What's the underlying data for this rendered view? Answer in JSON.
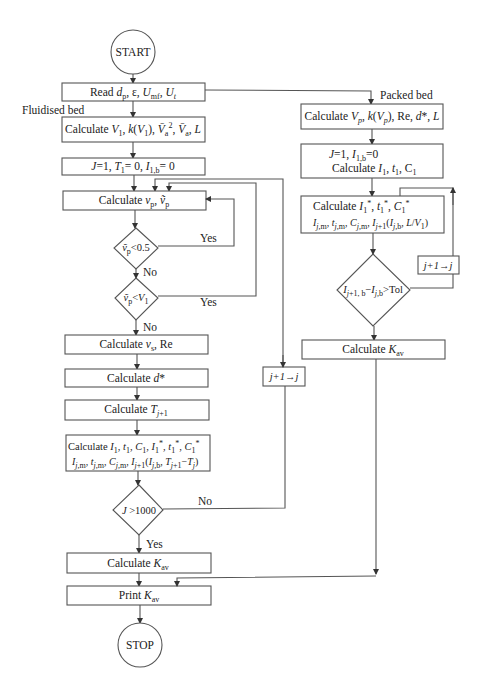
{
  "diagram": {
    "type": "flowchart",
    "colors": {
      "stroke": "#555555",
      "text": "#222222",
      "background": "#ffffff"
    },
    "terminals": {
      "start": "START",
      "stop": "STOP"
    },
    "branch_labels": {
      "fluidised": "Fluidised bed",
      "packed": "Packed bed"
    },
    "fluidised": {
      "read": "Read dp, ε, Umf, Ut",
      "calc_v1": "Calculate V1, k(V1), V̄a², V̄a, L",
      "init": "J=1, T1= 0, I1,b= 0",
      "calc_vp": "Calculate vp, ṽp",
      "dec1": "ṽp<0.5",
      "dec2": "ṽp<V1",
      "calc_vs": "Calculate vs, Re",
      "calc_d": "Calculate d*",
      "calc_t": "Calculate Tj+1",
      "calc_big_line1": "Calculate I1, t1, C1, I1*, t1*, C1*",
      "calc_big_line2": "Ij,m, tj,m, Cj,m, Ij+1(Ij,b, Tj+1−Tj)",
      "dec3": "J >1000",
      "incr": "j+1→j",
      "calc_kav": "Calculate Kav",
      "print_kav": "Print Kav"
    },
    "packed": {
      "calc_vp": "Calculate Vp, k(Vp), Re, d*, L",
      "init_line1": "J=1, I1,b=0",
      "init_line2": "Calculate I1, t1, C1",
      "calc_star_line1": "Calculate I1*, t1*, C1*",
      "calc_star_line2": "Ij,m, tj,m, Cj,m, Ij+1(Ij,b, L/V1)",
      "dec": "Ij+1, b−Ij,b>Tol",
      "incr": "j+1→j",
      "calc_kav": "Calculate Kav"
    },
    "edge_labels": {
      "yes": "Yes",
      "no": "No"
    }
  }
}
